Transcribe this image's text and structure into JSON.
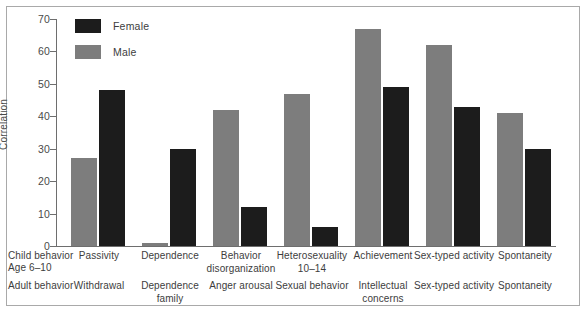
{
  "chart_data": {
    "type": "bar",
    "title": "",
    "xlabel": "",
    "ylabel": "Correlation",
    "ylim": [
      0,
      70
    ],
    "yticks": [
      0,
      10,
      20,
      30,
      40,
      50,
      60,
      70
    ],
    "grid": false,
    "legend_position": "top-left",
    "colors": {
      "female": "#1c1c1c",
      "male": "#7d7d7d",
      "axis": "#6e6e6e",
      "frame": "#a9a9a9",
      "text": "#3d3d3d",
      "background": "#ffffff"
    },
    "row_labels": {
      "child": "Child behavior Age 6–10",
      "child_line1": "Child behavior",
      "child_line2": "Age 6–10",
      "adult": "Adult behavior"
    },
    "categories_child": [
      "Passivity",
      "Dependence",
      "Behavior disorganization",
      "Heterosexuality 10–14",
      "Achievement",
      "Sex-typed activity",
      "Spontaneity"
    ],
    "categories_adult": [
      "Withdrawal",
      "Dependence family",
      "Anger arousal",
      "Sexual behavior",
      "Intellectual concerns",
      "Sex-typed activity",
      "Spontaneity"
    ],
    "categories_child_lines": [
      [
        "Passivity"
      ],
      [
        "Dependence"
      ],
      [
        "Behavior",
        "disorganization"
      ],
      [
        "Heterosexuality",
        "10–14"
      ],
      [
        "Achievement"
      ],
      [
        "Sex-typed activity"
      ],
      [
        "Spontaneity"
      ]
    ],
    "categories_adult_lines": [
      [
        "Withdrawal"
      ],
      [
        "Dependence",
        "family"
      ],
      [
        "Anger arousal"
      ],
      [
        "Sexual behavior"
      ],
      [
        "Intellectual",
        "concerns"
      ],
      [
        "Sex-typed activity"
      ],
      [
        "Spontaneity"
      ]
    ],
    "series": [
      {
        "name": "Female",
        "color": "#1c1c1c",
        "values": [
          48,
          30,
          12,
          6,
          49,
          43,
          30
        ]
      },
      {
        "name": "Male",
        "color": "#7d7d7d",
        "values": [
          27,
          1,
          42,
          47,
          67,
          62,
          41
        ]
      }
    ]
  },
  "legend": {
    "items": [
      {
        "label": "Female",
        "swatch": "female"
      },
      {
        "label": "Male",
        "swatch": "male"
      }
    ]
  },
  "axis": {
    "y_title": "Correlation",
    "y_tick_labels": [
      "70",
      "60",
      "50",
      "40",
      "30",
      "20",
      "10",
      "0"
    ]
  }
}
